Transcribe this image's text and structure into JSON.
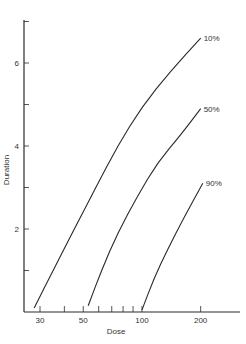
{
  "chart_data": {
    "type": "line",
    "title": "",
    "xlabel": "Dose",
    "ylabel": "Duration",
    "xscale": "log",
    "xlim": [
      26,
      260
    ],
    "ylim": [
      0,
      7
    ],
    "grid": false,
    "x_ticks_major": [
      30,
      50,
      100,
      200
    ],
    "x_ticks_minor": [
      40,
      60,
      70,
      80,
      90
    ],
    "y_ticks_major": [
      2,
      4,
      6
    ],
    "y_ticks_minor": [
      1,
      3,
      5,
      7
    ],
    "series": [
      {
        "name": "10%",
        "points": [
          [
            28,
            0.1
          ],
          [
            35,
            1.0
          ],
          [
            45,
            2.0
          ],
          [
            58,
            3.0
          ],
          [
            75,
            4.0
          ],
          [
            100,
            4.95
          ],
          [
            140,
            5.8
          ],
          [
            200,
            6.6
          ]
        ]
      },
      {
        "name": "50%",
        "points": [
          [
            53,
            0.15
          ],
          [
            62,
            1.0
          ],
          [
            75,
            1.9
          ],
          [
            95,
            2.8
          ],
          [
            120,
            3.6
          ],
          [
            160,
            4.3
          ],
          [
            200,
            4.9
          ]
        ]
      },
      {
        "name": "90%",
        "points": [
          [
            100,
            0.05
          ],
          [
            115,
            0.8
          ],
          [
            135,
            1.5
          ],
          [
            165,
            2.3
          ],
          [
            205,
            3.1
          ]
        ]
      }
    ],
    "annotations": [
      "10%",
      "50%",
      "90%"
    ]
  },
  "labels": {
    "xlabel": "Dose",
    "ylabel": "Duration",
    "x_tick_labels": [
      "30",
      "50",
      "100",
      "200"
    ],
    "y_tick_labels": [
      "2",
      "4",
      "6"
    ],
    "series_labels": [
      "10%",
      "50%",
      "90%"
    ]
  }
}
